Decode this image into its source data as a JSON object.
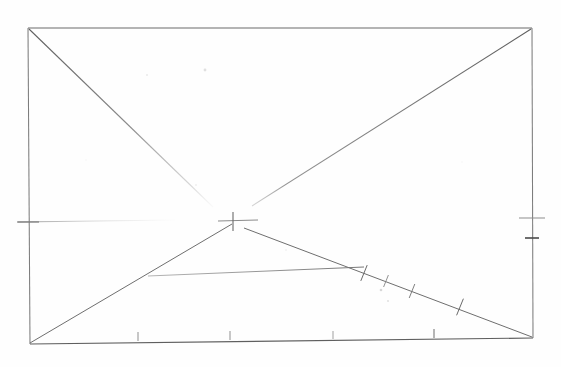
{
  "document": {
    "title": "Hand-drawn geometric construction sketch",
    "medium": "pencil on white paper",
    "background_color": "#fefefe",
    "ink_color": "#6b6b6b",
    "ink_color_dark": "#4a4a4a",
    "ink_color_faint": "#b4b4b4",
    "canvas": {
      "width": 561,
      "height": 367
    }
  },
  "figure": {
    "name": "rectangle-with-diagonals",
    "rectangle": {
      "name": "outer-rectangle",
      "corners": {
        "top_left": {
          "x": 28,
          "y": 28
        },
        "top_right": {
          "x": 532,
          "y": 28
        },
        "bottom_right": {
          "x": 533,
          "y": 338
        },
        "bottom_left": {
          "x": 30,
          "y": 344
        }
      },
      "stroke_width": 1.1
    },
    "center_mark": {
      "name": "center-cross-mark",
      "x": 232,
      "y": 221,
      "horizontal_extent": {
        "x1": 218,
        "x2": 258
      },
      "vertical_extent": {
        "y1": 212,
        "y2": 231
      },
      "label": "+"
    },
    "lines": [
      {
        "name": "diagonal-top-left-to-center",
        "x1": 29,
        "y1": 29,
        "x2": 213,
        "y2": 207,
        "stroke": "#7a7a7a",
        "width": 1.0,
        "fade": true
      },
      {
        "name": "diagonal-center-to-top-right",
        "x1": 252,
        "y1": 206,
        "x2": 531,
        "y2": 29,
        "stroke": "#6e6e6e",
        "width": 1.0,
        "fade": false
      },
      {
        "name": "diagonal-bottom-left-to-center",
        "x1": 30,
        "y1": 343,
        "x2": 232,
        "y2": 224,
        "stroke": "#6e6e6e",
        "width": 1.0,
        "fade": false
      },
      {
        "name": "diagonal-center-to-bottom-right",
        "x1": 244,
        "y1": 228,
        "x2": 532,
        "y2": 337,
        "stroke": "#6e6e6e",
        "width": 1.0,
        "fade": false
      },
      {
        "name": "horizontal-chord",
        "x1": 148,
        "y1": 276,
        "x2": 364,
        "y2": 267,
        "stroke": "#888888",
        "width": 0.9,
        "fade": false
      },
      {
        "name": "faint-horizontal-guide-left",
        "x1": 18,
        "y1": 222,
        "x2": 175,
        "y2": 220,
        "stroke": "#bcbcbc",
        "width": 0.9,
        "fade": true
      }
    ],
    "tick_marks": [
      {
        "name": "tick-left-edge",
        "edge": "left",
        "x": 28,
        "y": 222,
        "length": 22,
        "orientation": "horizontal",
        "stroke": "#707070"
      },
      {
        "name": "tick-right-edge",
        "edge": "right",
        "x": 532,
        "y": 218,
        "length": 26,
        "orientation": "horizontal",
        "stroke": "#8a8a8a"
      },
      {
        "name": "tick-right-edge-lower",
        "edge": "right",
        "x": 532,
        "y": 238,
        "length": 14,
        "orientation": "horizontal",
        "stroke": "#4a4a4a"
      },
      {
        "name": "tick-bottom-edge-1",
        "edge": "bottom",
        "x": 138,
        "y": 341,
        "length": 9,
        "orientation": "vertical",
        "stroke": "#8a8a8a"
      },
      {
        "name": "tick-bottom-edge-2",
        "edge": "bottom",
        "x": 230,
        "y": 340,
        "length": 9,
        "orientation": "vertical",
        "stroke": "#8a8a8a"
      },
      {
        "name": "tick-bottom-edge-3",
        "edge": "bottom",
        "x": 333,
        "y": 339,
        "length": 8,
        "orientation": "vertical",
        "stroke": "#9a9a9a"
      },
      {
        "name": "tick-bottom-edge-4",
        "edge": "bottom",
        "x": 434,
        "y": 338,
        "length": 9,
        "orientation": "vertical",
        "stroke": "#7a7a7a"
      }
    ],
    "diagonal_cross_ticks": [
      {
        "name": "cross-tick-1",
        "x": 364,
        "y": 273,
        "angle_deg": -68,
        "length": 17,
        "stroke": "#6a6a6a"
      },
      {
        "name": "cross-tick-2",
        "x": 386,
        "y": 281,
        "angle_deg": -68,
        "length": 13,
        "stroke": "#808080"
      },
      {
        "name": "cross-tick-3",
        "x": 412,
        "y": 291,
        "angle_deg": -68,
        "length": 15,
        "stroke": "#777777"
      },
      {
        "name": "cross-tick-4",
        "x": 460,
        "y": 307,
        "angle_deg": -68,
        "length": 18,
        "stroke": "#6a6a6a"
      }
    ],
    "smudges": [
      {
        "name": "smudge-1",
        "x": 205,
        "y": 70,
        "r": 1.4,
        "opacity": 0.3
      },
      {
        "name": "smudge-2",
        "x": 147,
        "y": 75,
        "r": 1.0,
        "opacity": 0.22
      },
      {
        "name": "smudge-3",
        "x": 381,
        "y": 290,
        "r": 1.3,
        "opacity": 0.35
      },
      {
        "name": "smudge-4",
        "x": 388,
        "y": 301,
        "r": 1.1,
        "opacity": 0.28
      },
      {
        "name": "smudge-5",
        "x": 196,
        "y": 185,
        "r": 0.9,
        "opacity": 0.2
      },
      {
        "name": "smudge-6",
        "x": 286,
        "y": 250,
        "r": 0.9,
        "opacity": 0.18
      },
      {
        "name": "smudge-7",
        "x": 462,
        "y": 162,
        "r": 0.8,
        "opacity": 0.15
      },
      {
        "name": "smudge-8",
        "x": 86,
        "y": 160,
        "r": 0.8,
        "opacity": 0.15
      }
    ]
  }
}
